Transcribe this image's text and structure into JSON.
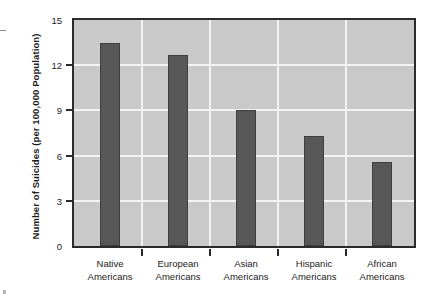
{
  "chart_data": {
    "type": "bar",
    "title": "",
    "xlabel": "",
    "ylabel": "Number of Suicides (per 100,000 Population)",
    "categories": [
      "Native Americans",
      "European Americans",
      "Asian Americans",
      "Hispanic Americans",
      "African Americans"
    ],
    "category_lines": [
      [
        "Native",
        "Americans"
      ],
      [
        "European",
        "Americans"
      ],
      [
        "Asian",
        "Americans"
      ],
      [
        "Hispanic",
        "Americans"
      ],
      [
        "African",
        "Americans"
      ]
    ],
    "values": [
      13.5,
      12.7,
      9.0,
      7.3,
      5.6
    ],
    "ylim": [
      0,
      15
    ],
    "yticks": [
      0,
      3,
      6,
      9,
      12,
      15
    ],
    "ytick_labels": [
      "0",
      "3",
      "6",
      "9",
      "12",
      "15"
    ],
    "grid": true,
    "legend": "none",
    "bar_color": "#575757",
    "plot_background": "#c9c9c9",
    "grid_color": "#f3f3f3",
    "axis_color": "#2b2b2b",
    "page_background": "#ffffff"
  }
}
